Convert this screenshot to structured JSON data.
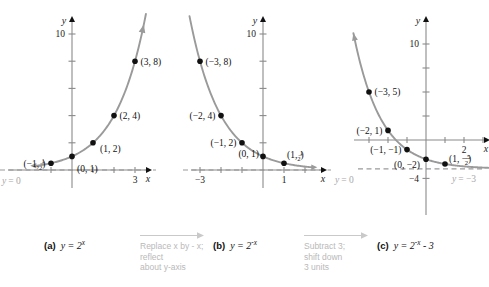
{
  "figure": {
    "panels": [
      {
        "key": "a",
        "lead": "(a)",
        "equation_base": "y = 2",
        "equation_exp": "x",
        "equation_plain": "y = 2^x",
        "xlabel": "x",
        "ylabel": "y",
        "x_ticklabels": [
          {
            "value": 3,
            "text": "3"
          }
        ],
        "y_ticklabels": [
          {
            "value": 10,
            "text": "10"
          }
        ],
        "y_ticks": [
          2,
          4,
          6,
          8,
          10
        ],
        "x_ticks": [
          -1,
          1,
          2,
          3
        ],
        "asymptote": {
          "value": 0,
          "label": "y = 0",
          "label_lhs": "y",
          "label_rhs": "= 0"
        },
        "points": [
          {
            "x": -1,
            "y": 0.5,
            "label": "(-1, 1/2)",
            "anchor": "left"
          },
          {
            "x": 0,
            "y": 1,
            "label": "(0, 1)",
            "anchor": "right"
          },
          {
            "x": 1,
            "y": 2,
            "label": "(1, 2)",
            "anchor": "right"
          },
          {
            "x": 2,
            "y": 4,
            "label": "(2, 4)",
            "anchor": "right"
          },
          {
            "x": 3,
            "y": 8,
            "label": "(3, 8)",
            "anchor": "right"
          }
        ]
      },
      {
        "key": "b",
        "lead": "(b)",
        "equation_base": "y = 2",
        "equation_exp": "-x",
        "equation_plain": "y = 2^-x",
        "xlabel": "x",
        "ylabel": "y",
        "x_ticklabels": [
          {
            "value": -3,
            "text": "-3"
          },
          {
            "value": 1,
            "text": "1"
          }
        ],
        "y_ticklabels": [
          {
            "value": 10,
            "text": "10"
          }
        ],
        "y_ticks": [
          2,
          4,
          6,
          8,
          10
        ],
        "x_ticks": [
          -3,
          -2,
          -1,
          1,
          2
        ],
        "asymptote": {
          "value": 0,
          "label": "y = 0",
          "label_lhs": "y",
          "label_rhs": "= 0"
        },
        "points": [
          {
            "x": -3,
            "y": 8,
            "label": "(-3, 8)",
            "anchor": "right"
          },
          {
            "x": -2,
            "y": 4,
            "label": "(-2, 4)",
            "anchor": "left"
          },
          {
            "x": -1,
            "y": 2,
            "label": "(-1, 2)",
            "anchor": "left"
          },
          {
            "x": 0,
            "y": 1,
            "label": "(0, 1)",
            "anchor": "left"
          },
          {
            "x": 1,
            "y": 0.5,
            "label": "(1, 1/2)",
            "anchor": "right"
          }
        ]
      },
      {
        "key": "c",
        "lead": "(c)",
        "equation_base": "y = 2",
        "equation_exp": "-x",
        "equation_tail": " - 3",
        "equation_plain": "y = 2^-x - 3",
        "xlabel": "x",
        "ylabel": "y",
        "x_ticklabels": [
          {
            "value": 2,
            "text": "2"
          }
        ],
        "y_ticklabels": [
          {
            "value": 10,
            "text": "10"
          },
          {
            "value": -4,
            "text": "-4"
          }
        ],
        "y_ticks": [
          -4,
          2.5,
          5,
          7.5,
          10
        ],
        "x_ticks": [
          -3,
          -2,
          -1,
          1,
          2,
          3
        ],
        "asymptote": {
          "value": -3,
          "label": "y = -3",
          "label_lhs": "y",
          "label_rhs": "= -3"
        },
        "points": [
          {
            "x": -3,
            "y": 5,
            "label": "(-3, 5)",
            "anchor": "right"
          },
          {
            "x": -2,
            "y": 1,
            "label": "(-2, 1)",
            "anchor": "left"
          },
          {
            "x": -1,
            "y": -1,
            "label": "(-1, -1)",
            "anchor": "left"
          },
          {
            "x": 0,
            "y": -2,
            "label": "(0, -2)",
            "anchor": "left"
          },
          {
            "x": 1,
            "y": -2.5,
            "label": "(1, -5/2)",
            "anchor": "right"
          }
        ]
      }
    ],
    "transitions": [
      {
        "key": "t1",
        "text": "Replace x by - x;\nreflect\nabout y-axis"
      },
      {
        "key": "t2",
        "text": "Subtract 3;\nshift down\n3 units"
      }
    ],
    "colors": {
      "curve": "#9a9a9a",
      "axis": "#8a8a8a",
      "point": "#111111",
      "asymptote": "#9a9a9a",
      "note": "#b9b9b9",
      "background": "#ffffff"
    }
  },
  "chart_data": [
    {
      "type": "line",
      "title": "(a) y = 2^x",
      "xlabel": "x",
      "ylabel": "y",
      "xlim": [
        -1.8,
        3.9
      ],
      "ylim": [
        -1.2,
        11.5
      ],
      "grid": false,
      "legend": null,
      "function": "y = 2^x",
      "asymptote": 0,
      "asymptote_label": "y = 0",
      "x": [
        -1,
        0,
        1,
        2,
        3
      ],
      "values": [
        0.5,
        1,
        2,
        4,
        8
      ],
      "point_labels": [
        "(-1, 1/2)",
        "(0, 1)",
        "(1, 2)",
        "(2, 4)",
        "(3, 8)"
      ],
      "xticks": [
        3
      ],
      "yticks": [
        10
      ]
    },
    {
      "type": "line",
      "title": "(b) y = 2^-x",
      "xlabel": "x",
      "ylabel": "y",
      "xlim": [
        -3.9,
        2.4
      ],
      "ylim": [
        -1.2,
        11.5
      ],
      "grid": false,
      "legend": null,
      "function": "y = 2^(-x)",
      "asymptote": 0,
      "asymptote_label": "y = 0",
      "x": [
        -3,
        -2,
        -1,
        0,
        1
      ],
      "values": [
        8,
        4,
        2,
        1,
        0.5
      ],
      "point_labels": [
        "(-3, 8)",
        "(-2, 4)",
        "(-1, 2)",
        "(0, 1)",
        "(1, 1/2)"
      ],
      "xticks": [
        -3,
        1
      ],
      "yticks": [
        10
      ]
    },
    {
      "type": "line",
      "title": "(c) y = 2^-x - 3",
      "xlabel": "x",
      "ylabel": "y",
      "xlim": [
        -3.9,
        3.6
      ],
      "ylim": [
        -5.2,
        11.5
      ],
      "grid": false,
      "legend": null,
      "function": "y = 2^(-x) - 3",
      "asymptote": -3,
      "asymptote_label": "y = -3",
      "x": [
        -3,
        -2,
        -1,
        0,
        1
      ],
      "values": [
        5,
        1,
        -1,
        -2,
        -2.5
      ],
      "point_labels": [
        "(-3, 5)",
        "(-2, 1)",
        "(-1, -1)",
        "(0, -2)",
        "(1, -5/2)"
      ],
      "xticks": [
        2
      ],
      "yticks": [
        10,
        -4
      ]
    }
  ]
}
